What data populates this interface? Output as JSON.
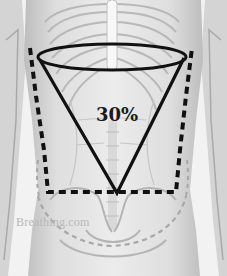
{
  "figure": {
    "percentage_label": "30%",
    "watermark": "Breathing.com",
    "colors": {
      "background": "#f2f2f2",
      "anatomy_light": "#e6e6e6",
      "anatomy_mid": "#c9c9c9",
      "anatomy_dark": "#9a9a9a",
      "overlay_solid": "#111111",
      "overlay_dashed": "#111111",
      "pelvis_dashed": "#a8a8a8",
      "watermark": "#b9b9b9"
    },
    "shapes": [
      {
        "name": "upper-chest-ellipse",
        "type": "ellipse",
        "style": "solid"
      },
      {
        "name": "cone-triangle",
        "type": "triangle",
        "style": "solid"
      },
      {
        "name": "abdomen-outline",
        "type": "polyline",
        "style": "dashed-heavy"
      },
      {
        "name": "pelvis-curve",
        "type": "curve",
        "style": "dashed-light"
      }
    ]
  }
}
